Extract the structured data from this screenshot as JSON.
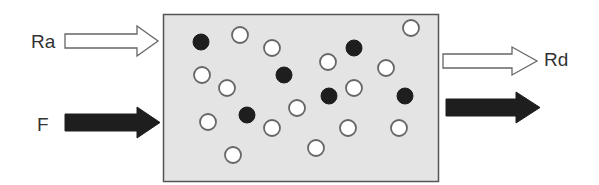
{
  "diagram": {
    "colors": {
      "background": "#ffffff",
      "box_fill": "#e4e4e4",
      "box_stroke": "#555555",
      "dark": "#1e1e1e",
      "light_fill": "#ffffff",
      "outline": "#666666"
    },
    "labels": {
      "ra": "Ra",
      "rd": "Rd",
      "f": "F"
    },
    "container": {
      "x": 163,
      "y": 14,
      "width": 275,
      "height": 167
    },
    "arrows": [
      {
        "id": "ra",
        "label": "Ra",
        "style": "hollow",
        "direction": "in",
        "side": "left"
      },
      {
        "id": "f",
        "label": "F",
        "style": "filled",
        "direction": "in",
        "side": "left"
      },
      {
        "id": "rd",
        "label": "Rd",
        "style": "hollow",
        "direction": "out",
        "side": "right"
      },
      {
        "id": "out-filled",
        "label": "",
        "style": "filled",
        "direction": "out",
        "side": "right"
      }
    ],
    "particles": {
      "radius": 8,
      "filled": [
        {
          "x": 201,
          "y": 42
        },
        {
          "x": 284,
          "y": 75
        },
        {
          "x": 354,
          "y": 48
        },
        {
          "x": 329,
          "y": 96
        },
        {
          "x": 405,
          "y": 96
        },
        {
          "x": 247,
          "y": 115
        }
      ],
      "hollow": [
        {
          "x": 240,
          "y": 35
        },
        {
          "x": 272,
          "y": 48
        },
        {
          "x": 202,
          "y": 75
        },
        {
          "x": 227,
          "y": 88
        },
        {
          "x": 411,
          "y": 28
        },
        {
          "x": 328,
          "y": 62
        },
        {
          "x": 386,
          "y": 68
        },
        {
          "x": 354,
          "y": 88
        },
        {
          "x": 208,
          "y": 122
        },
        {
          "x": 272,
          "y": 128
        },
        {
          "x": 297,
          "y": 108
        },
        {
          "x": 348,
          "y": 128
        },
        {
          "x": 399,
          "y": 128
        },
        {
          "x": 233,
          "y": 155
        },
        {
          "x": 316,
          "y": 148
        }
      ]
    }
  }
}
